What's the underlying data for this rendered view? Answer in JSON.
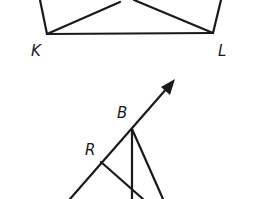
{
  "diagram": {
    "stroke_color": "#1a1a1a",
    "background": "#ffffff",
    "top_figure": {
      "labels": {
        "K": "K",
        "L": "L"
      },
      "points": {
        "K": [
          47,
          34
        ],
        "L": [
          213,
          33
        ]
      },
      "segments": [
        {
          "name": "left-side",
          "from": [
            40,
            0
          ],
          "to": [
            47,
            34
          ]
        },
        {
          "name": "base-KL",
          "from": [
            47,
            34
          ],
          "to": [
            213,
            33
          ]
        },
        {
          "name": "right-side",
          "from": [
            221,
            0
          ],
          "to": [
            213,
            33
          ]
        },
        {
          "name": "K-to-top",
          "from": [
            47,
            34
          ],
          "to": [
            120,
            2
          ]
        },
        {
          "name": "L-to-top",
          "from": [
            134,
            0
          ],
          "to": [
            213,
            33
          ]
        }
      ]
    },
    "bottom_figure": {
      "labels": {
        "B": "B",
        "R": "R"
      },
      "points": {
        "B": [
          132,
          129
        ],
        "R": [
          101,
          162
        ]
      },
      "ray": {
        "name": "ray-through-R-B",
        "from": [
          70,
          199
        ],
        "to": [
          175,
          79
        ],
        "arrowhead": true
      },
      "segments": [
        {
          "name": "B-vertical",
          "from": [
            132,
            129
          ],
          "to": [
            132,
            199
          ]
        },
        {
          "name": "B-diagonal",
          "from": [
            132,
            129
          ],
          "to": [
            163,
            199
          ]
        },
        {
          "name": "R-diagonal",
          "from": [
            101,
            162
          ],
          "to": [
            143,
            199
          ]
        }
      ]
    }
  }
}
